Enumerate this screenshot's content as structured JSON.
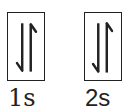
{
  "diagram": {
    "type": "orbital-box-diagram",
    "colors": {
      "stroke": "#222222",
      "background": "#ffffff"
    },
    "orbitals": [
      {
        "label": "1s",
        "electrons": [
          "down",
          "up"
        ],
        "electron_count": 2
      },
      {
        "label": "2s",
        "electrons": [
          "down",
          "up"
        ],
        "electron_count": 2
      }
    ]
  }
}
